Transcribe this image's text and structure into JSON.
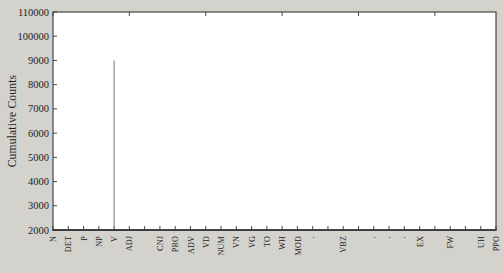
{
  "chart_data": {
    "type": "line",
    "title": "",
    "subtitle": "",
    "xlabel": "",
    "ylabel": "Cumulative Counts",
    "ylim": [
      2000,
      110000
    ],
    "grid": false,
    "legend_position": "none",
    "y_tick_labels": [
      "110000",
      "100000",
      "9000",
      "8000",
      "7000",
      "6000",
      "5000",
      "4000",
      "3000",
      "2000"
    ],
    "y_tick_values": [
      110000,
      100000,
      90000,
      80000,
      70000,
      60000,
      50000,
      40000,
      30000,
      20000
    ],
    "categories": [
      "N",
      "DET",
      "P",
      "NP",
      "V",
      "ADJ",
      "",
      "CNJ",
      "PRO",
      "ADV",
      "VD",
      "NUM",
      "VN",
      "VG",
      "TO",
      "WH",
      "MOD",
      "·",
      "",
      "VBZ",
      "",
      "·",
      "·",
      "·",
      "EX",
      "",
      "FW",
      "",
      "UH",
      "PPO"
    ],
    "x_index": [
      0,
      1,
      2,
      3,
      4,
      5,
      6,
      7,
      8,
      9,
      10,
      11,
      12,
      13,
      14,
      15,
      16,
      17,
      18,
      19,
      20,
      21,
      22,
      23,
      24,
      25,
      26,
      27,
      28,
      29
    ],
    "values": [
      2150,
      3320,
      4120,
      5120,
      6000,
      6780,
      7450,
      8000,
      8480,
      8890,
      9230,
      9520,
      9760,
      9950,
      10110,
      10240,
      10340,
      10420,
      10480,
      10530,
      10570,
      10600,
      10620,
      10640,
      10655,
      10665,
      10672,
      10678,
      10681,
      10683
    ],
    "values_scale_note": "plotted against the rendered tick scale 2000..110000",
    "annotations": {
      "crosshair": {
        "x_category": "V",
        "x_index": 4,
        "y_value": 6000,
        "y_label": "6000",
        "color": "#8a8a8a",
        "description": "vertical reference line at tag V and horizontal reference line at 6000 meeting on the curve"
      }
    },
    "caption": ""
  },
  "axes": {
    "y_title": "Cumulative Counts"
  },
  "colors": {
    "page_background": "#d4d2cd",
    "plot_background": "#ffffff",
    "frame": "#39383a",
    "curve": "#232225",
    "guide": "#8a8a8a",
    "text": "#1c1c1c"
  }
}
